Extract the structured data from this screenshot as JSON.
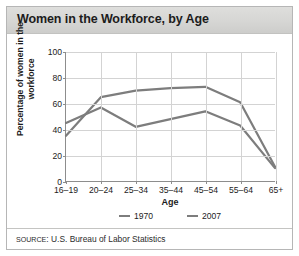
{
  "figure": {
    "title": "Women in the Workforce, by Age",
    "source_prefix": "SOURCE",
    "source_rest": ": U.S. Bureau of Labor Statistics"
  },
  "chart_data": {
    "type": "line",
    "title": "Women in the Workforce, by Age",
    "xlabel": "Age",
    "ylabel": "Percentage of women in the workforce",
    "categories": [
      "16–19",
      "20–24",
      "25–34",
      "35–44",
      "45–54",
      "55–64",
      "65+"
    ],
    "yticks": [
      0,
      20,
      40,
      60,
      80,
      100
    ],
    "ylim": [
      0,
      100
    ],
    "grid": true,
    "legend_position": "bottom",
    "series": [
      {
        "name": "1970",
        "color": "#7d7d7d",
        "values": [
          45,
          57,
          42,
          48,
          54,
          43,
          10
        ]
      },
      {
        "name": "2007",
        "color": "#7d7d7d",
        "values": [
          35,
          65,
          70,
          72,
          73,
          61,
          11
        ]
      }
    ]
  }
}
